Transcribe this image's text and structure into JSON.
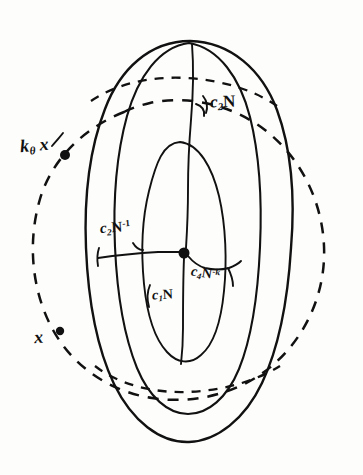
{
  "figure": {
    "kind": "hand-drawn-diagram",
    "background_color": "#fdfdfb",
    "ink_color": "#111111",
    "width": 363,
    "height": 475
  },
  "labels": {
    "c2n": {
      "base": "c",
      "sub": "2",
      "rest": "N",
      "text": "c2N"
    },
    "ktheta_x": {
      "base": "k",
      "sub": "θ",
      "rest": "x",
      "text": "kθ x"
    },
    "c2n_inverse": {
      "base": "c",
      "sub": "2",
      "rest": "N",
      "sup": "-1",
      "text": "c2N-1"
    },
    "c4n_k": {
      "base": "c",
      "sub": "4",
      "rest": "N",
      "sup": "-k",
      "text": "c4N-k"
    },
    "c1n": {
      "base": "c",
      "sub": "1",
      "rest": "N",
      "text": "c1N"
    },
    "x": {
      "text": "x"
    }
  },
  "nodes": [
    {
      "name": "point-ktheta-x",
      "label": "kθ x",
      "x": 65,
      "y": 155,
      "radius": 5
    },
    {
      "name": "point-x",
      "label": "x",
      "x": 60,
      "y": 331,
      "radius": 4
    },
    {
      "name": "point-center",
      "label": "basepoint",
      "x": 184,
      "y": 253,
      "radius": 5.5
    }
  ],
  "shapes": {
    "dashed_circle": {
      "name": "outer-dashed-circle",
      "style": "dashed",
      "cx": 181,
      "cy": 247,
      "rx": 152,
      "ry": 143
    },
    "outer_ellipse": {
      "name": "outer-solid-ellipse",
      "style": "solid",
      "cx": 188,
      "cy": 245,
      "rx": 98,
      "ry": 205
    },
    "middle_ellipse": {
      "name": "middle-solid-ellipse",
      "style": "solid",
      "cx": 180,
      "cy": 245,
      "rx": 80,
      "ry": 160
    },
    "inner_ellipse": {
      "name": "inner-solid-ellipse",
      "style": "solid",
      "cx": 180,
      "cy": 253,
      "rx": 44,
      "ry": 110
    }
  }
}
